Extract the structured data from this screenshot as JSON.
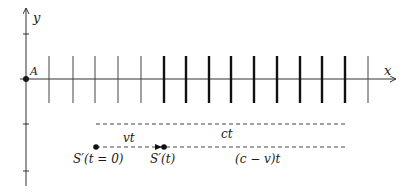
{
  "diagram": {
    "axes": {
      "x_label": "x",
      "y_label": "y",
      "origin_label": "A"
    },
    "ticks": {
      "thin": [
        49,
        73,
        95,
        118,
        141,
        368
      ],
      "thick": [
        164,
        186,
        209,
        231,
        254,
        277,
        300,
        322,
        345
      ]
    },
    "segments": {
      "ct_label": "ct",
      "vt_label": "vt",
      "cvt_label": "(c − v)t"
    },
    "points": {
      "s_start_label": "S′(t = 0)",
      "s_t_label": "S′(t)"
    },
    "colors": {
      "ink": "#1a1a1a",
      "axis": "#333333"
    }
  }
}
